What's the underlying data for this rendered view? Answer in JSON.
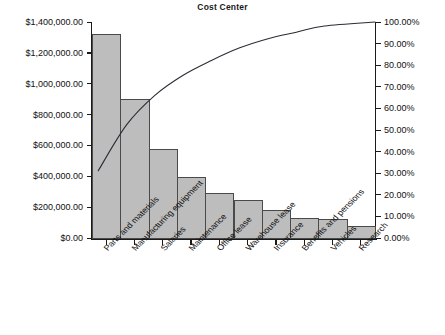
{
  "chart_data": {
    "type": "bar",
    "title": "Cost Center",
    "xlabel": "",
    "ylabel": "",
    "categories": [
      "Parts and materials",
      "Manufacturing equipment",
      "Salaries",
      "Maintenance",
      "Office lease",
      "Warehouse lease",
      "Insurance",
      "Benefits and pensions",
      "Vehicles",
      "Research"
    ],
    "values": [
      1320000,
      900000,
      580000,
      395000,
      290000,
      248000,
      180000,
      128000,
      122000,
      78000
    ],
    "cumulative_percent": [
      31.13,
      52.35,
      66.03,
      75.34,
      82.18,
      88.03,
      92.27,
      95.29,
      98.17,
      100.0
    ],
    "ylim": [
      0,
      1400000
    ],
    "y2lim": [
      0,
      100
    ],
    "ytick_labels": [
      "$0.00",
      "$200,000.00",
      "$400,000.00",
      "$600,000.00",
      "$800,000.00",
      "$1,000,000.00",
      "$1,200,000.00",
      "$1,400,000.00"
    ],
    "ytick_values": [
      0,
      200000,
      400000,
      600000,
      800000,
      1000000,
      1200000,
      1400000
    ],
    "y2tick_labels": [
      "0.00%",
      "10.00%",
      "20.00%",
      "30.00%",
      "40.00%",
      "50.00%",
      "60.00%",
      "70.00%",
      "80.00%",
      "90.00%",
      "100.00%"
    ],
    "y2tick_values": [
      0,
      10,
      20,
      30,
      40,
      50,
      60,
      70,
      80,
      90,
      100
    ],
    "grid": false,
    "legend": false,
    "series": [
      {
        "name": "Cost",
        "type": "bar",
        "values": [
          1320000,
          900000,
          580000,
          395000,
          290000,
          248000,
          180000,
          128000,
          122000,
          78000
        ]
      },
      {
        "name": "Cumulative",
        "type": "line",
        "values": [
          31.13,
          52.35,
          66.03,
          75.34,
          82.18,
          88.03,
          92.27,
          95.29,
          98.17,
          100.0
        ]
      }
    ],
    "colors": {
      "bar_fill": "#bdbdbd",
      "bar_stroke": "#4a4a4a",
      "line": "#2b2b35",
      "axis": "#1a1a1a",
      "text": "#111111",
      "background": "#ffffff"
    }
  }
}
